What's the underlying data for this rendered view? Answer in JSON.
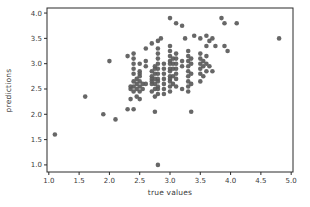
{
  "figure": {
    "background": "#ffffff",
    "axes_color": "#2b2b2b",
    "tick_label_color": "#3a3a3a"
  },
  "chart_data": {
    "type": "scatter",
    "title": "",
    "xlabel": "true values",
    "ylabel": "predictions",
    "grid": false,
    "legend": null,
    "xlim": [
      0.97,
      5.03
    ],
    "ylim": [
      0.86,
      4.1
    ],
    "x_ticks": [
      1.0,
      1.5,
      2.0,
      2.5,
      3.0,
      3.5,
      4.0,
      4.5,
      5.0
    ],
    "y_ticks": [
      1.0,
      1.5,
      2.0,
      2.5,
      3.0,
      3.5,
      4.0
    ],
    "x_tick_labels": [
      "1.0",
      "1.5",
      "2.0",
      "2.5",
      "3.0",
      "3.5",
      "4.0",
      "4.5",
      "5.0"
    ],
    "y_tick_labels": [
      "1.0",
      "1.5",
      "2.0",
      "2.5",
      "3.0",
      "3.5",
      "4.0"
    ],
    "marker": {
      "shape": "circle",
      "color": "#5a5a5a",
      "diameter_px": 5
    },
    "points": [
      [
        1.1,
        1.6
      ],
      [
        1.6,
        2.35
      ],
      [
        1.9,
        2.0
      ],
      [
        2.1,
        1.9
      ],
      [
        2.3,
        2.1
      ],
      [
        2.4,
        2.1
      ],
      [
        2.75,
        2.05
      ],
      [
        3.35,
        2.05
      ],
      [
        2.35,
        2.3
      ],
      [
        2.5,
        2.3
      ],
      [
        2.75,
        2.35
      ],
      [
        2.9,
        2.4
      ],
      [
        2.8,
        1.0
      ],
      [
        2.0,
        3.05
      ],
      [
        2.3,
        3.15
      ],
      [
        2.35,
        2.5
      ],
      [
        2.35,
        2.55
      ],
      [
        2.4,
        2.45
      ],
      [
        2.4,
        2.55
      ],
      [
        2.4,
        2.65
      ],
      [
        2.4,
        2.8
      ],
      [
        2.4,
        2.9
      ],
      [
        2.4,
        3.0
      ],
      [
        2.4,
        3.1
      ],
      [
        2.4,
        3.2
      ],
      [
        2.45,
        2.35
      ],
      [
        2.45,
        2.5
      ],
      [
        2.45,
        2.6
      ],
      [
        2.45,
        2.7
      ],
      [
        2.5,
        2.45
      ],
      [
        2.5,
        2.55
      ],
      [
        2.5,
        2.65
      ],
      [
        2.5,
        2.75
      ],
      [
        2.5,
        2.8
      ],
      [
        2.5,
        2.85
      ],
      [
        2.5,
        3.0
      ],
      [
        2.55,
        2.5
      ],
      [
        2.55,
        2.6
      ],
      [
        2.6,
        2.6
      ],
      [
        2.6,
        2.95
      ],
      [
        2.6,
        3.05
      ],
      [
        2.6,
        3.3
      ],
      [
        2.7,
        2.45
      ],
      [
        2.7,
        2.6
      ],
      [
        2.7,
        2.65
      ],
      [
        2.7,
        2.7
      ],
      [
        2.7,
        2.75
      ],
      [
        2.7,
        2.85
      ],
      [
        2.7,
        3.4
      ],
      [
        2.75,
        2.5
      ],
      [
        2.75,
        2.6
      ],
      [
        2.75,
        2.7
      ],
      [
        2.75,
        2.8
      ],
      [
        2.75,
        2.9
      ],
      [
        2.75,
        2.95
      ],
      [
        2.8,
        2.4
      ],
      [
        2.8,
        2.5
      ],
      [
        2.8,
        2.55
      ],
      [
        2.8,
        2.65
      ],
      [
        2.8,
        2.7
      ],
      [
        2.8,
        2.8
      ],
      [
        2.8,
        2.9
      ],
      [
        2.8,
        3.0
      ],
      [
        2.8,
        3.1
      ],
      [
        2.8,
        3.2
      ],
      [
        2.8,
        3.3
      ],
      [
        2.8,
        3.45
      ],
      [
        2.85,
        3.5
      ],
      [
        2.9,
        2.5
      ],
      [
        2.9,
        2.6
      ],
      [
        2.9,
        2.7
      ],
      [
        2.9,
        2.8
      ],
      [
        2.9,
        2.9
      ],
      [
        2.9,
        3.0
      ],
      [
        3.0,
        2.45
      ],
      [
        3.0,
        2.55
      ],
      [
        3.0,
        2.65
      ],
      [
        3.0,
        2.7
      ],
      [
        3.0,
        2.75
      ],
      [
        3.0,
        2.85
      ],
      [
        3.0,
        2.9
      ],
      [
        3.0,
        3.0
      ],
      [
        3.0,
        3.05
      ],
      [
        3.0,
        3.15
      ],
      [
        3.0,
        3.25
      ],
      [
        3.0,
        3.35
      ],
      [
        3.0,
        3.9
      ],
      [
        3.05,
        2.6
      ],
      [
        3.05,
        2.75
      ],
      [
        3.05,
        2.9
      ],
      [
        3.05,
        3.0
      ],
      [
        3.05,
        3.1
      ],
      [
        3.1,
        2.55
      ],
      [
        3.1,
        2.7
      ],
      [
        3.1,
        2.8
      ],
      [
        3.1,
        2.9
      ],
      [
        3.1,
        3.0
      ],
      [
        3.1,
        3.1
      ],
      [
        3.1,
        3.2
      ],
      [
        3.1,
        3.8
      ],
      [
        3.2,
        2.5
      ],
      [
        3.2,
        2.95
      ],
      [
        3.2,
        3.05
      ],
      [
        3.2,
        3.75
      ],
      [
        3.25,
        3.5
      ],
      [
        3.3,
        2.45
      ],
      [
        3.3,
        2.55
      ],
      [
        3.3,
        2.65
      ],
      [
        3.3,
        2.75
      ],
      [
        3.3,
        2.85
      ],
      [
        3.3,
        2.95
      ],
      [
        3.3,
        3.05
      ],
      [
        3.3,
        3.15
      ],
      [
        3.3,
        3.25
      ],
      [
        3.35,
        2.6
      ],
      [
        3.35,
        2.8
      ],
      [
        3.35,
        3.0
      ],
      [
        3.35,
        3.1
      ],
      [
        3.4,
        3.55
      ],
      [
        3.5,
        2.65
      ],
      [
        3.5,
        2.8
      ],
      [
        3.5,
        2.9
      ],
      [
        3.5,
        3.0
      ],
      [
        3.5,
        3.1
      ],
      [
        3.5,
        3.2
      ],
      [
        3.5,
        3.5
      ],
      [
        3.55,
        2.75
      ],
      [
        3.55,
        2.95
      ],
      [
        3.55,
        3.05
      ],
      [
        3.6,
        2.85
      ],
      [
        3.6,
        3.0
      ],
      [
        3.6,
        3.15
      ],
      [
        3.6,
        3.35
      ],
      [
        3.6,
        3.55
      ],
      [
        3.65,
        2.95
      ],
      [
        3.65,
        3.45
      ],
      [
        3.7,
        2.85
      ],
      [
        3.7,
        3.5
      ],
      [
        3.75,
        3.35
      ],
      [
        3.85,
        3.9
      ],
      [
        3.9,
        3.35
      ],
      [
        3.9,
        3.8
      ],
      [
        3.95,
        3.25
      ],
      [
        4.1,
        3.8
      ],
      [
        4.8,
        3.5
      ]
    ]
  }
}
